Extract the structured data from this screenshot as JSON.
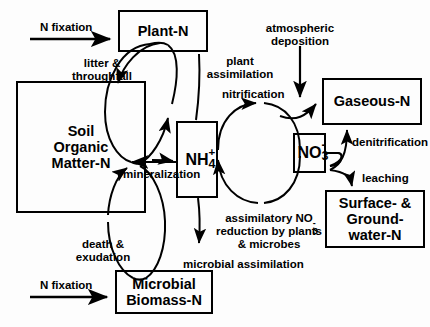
{
  "diagram": {
    "stroke_color": "#000000",
    "background_color": "#fdfdfd"
  },
  "pools": [
    {
      "id": "plant",
      "name": "Plant-N",
      "lines": [
        "Plant-N"
      ]
    },
    {
      "id": "soil",
      "name": "Soil Organic Matter-N",
      "lines": [
        "Soil",
        "Organic",
        "Matter-N"
      ]
    },
    {
      "id": "microbial",
      "name": "Microbial Biomass-N",
      "lines": [
        "Microbial",
        "Biomass-N"
      ]
    },
    {
      "id": "nh4",
      "name": "NH4+",
      "base": "NH",
      "sup": "+",
      "sub": "4"
    },
    {
      "id": "no3",
      "name": "NO3-",
      "base": "NO",
      "sup": "-",
      "sub": "3"
    },
    {
      "id": "gaseous",
      "name": "Gaseous-N",
      "lines": [
        "Gaseous-N"
      ]
    },
    {
      "id": "water",
      "name": "Surface- & Groundwater-N",
      "lines": [
        "Surface- &",
        "Ground-",
        "water-N"
      ]
    }
  ],
  "fluxes": {
    "n_fixation_top": "N fixation",
    "n_fixation_bottom": "N fixation",
    "litter_throughfall": [
      "litter &",
      "throughfall"
    ],
    "plant_assimilation": [
      "plant",
      "assimilation"
    ],
    "atmospheric_deposition": [
      "atmospheric",
      "deposition"
    ],
    "nitrification": "nitrification",
    "denitrification": "denitrification",
    "leaching": "leaching",
    "mineralization": "mineralization",
    "assimilatory_reduction": {
      "line1_pre": "assimilatory NO",
      "line1_sub": "3",
      "line1_sup": "-",
      "line2": "reduction by plants",
      "line3": "& microbes"
    },
    "microbial_assimilation": "microbial assimilation",
    "death_exudation": [
      "death &",
      "exudation"
    ]
  }
}
